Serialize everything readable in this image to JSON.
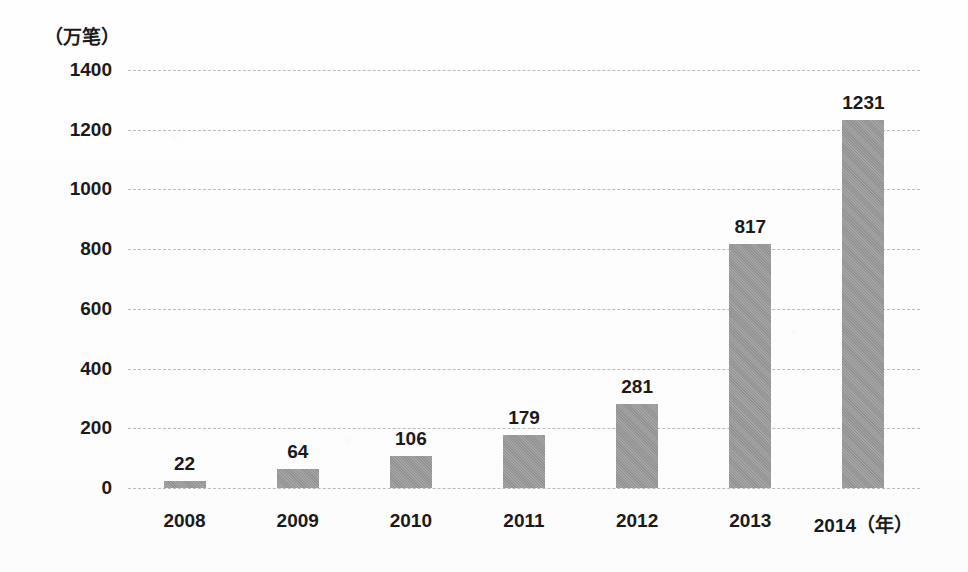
{
  "chart_data": {
    "type": "bar",
    "title": "",
    "subtitle": "",
    "xlabel": "（年）",
    "ylabel": "（万笔）",
    "categories": [
      "2008",
      "2009",
      "2010",
      "2011",
      "2012",
      "2013",
      "2014"
    ],
    "values": [
      22,
      64,
      106,
      179,
      281,
      817,
      1231
    ],
    "value_labels": [
      "22",
      "64",
      "106",
      "179",
      "281",
      "817",
      "1231"
    ],
    "x_tick_labels": [
      "2008",
      "2009",
      "2010",
      "2011",
      "2012",
      "2013",
      "2014（年）"
    ],
    "ylim": [
      0,
      1400
    ],
    "y_ticks": [
      0,
      200,
      400,
      600,
      800,
      1000,
      1200,
      1400
    ],
    "y_tick_labels": [
      "0",
      "200",
      "400",
      "600",
      "800",
      "1000",
      "1200",
      "1400"
    ],
    "grid": "horizontal-dashed",
    "legend": "none",
    "series": [
      {
        "name": "",
        "values": [
          22,
          64,
          106,
          179,
          281,
          817,
          1231
        ]
      }
    ],
    "colors": {
      "bar": "#9a9a9a",
      "gridline": "#b9b9b9",
      "text": "#1a1a1a",
      "background": "#fdfdfd"
    }
  }
}
